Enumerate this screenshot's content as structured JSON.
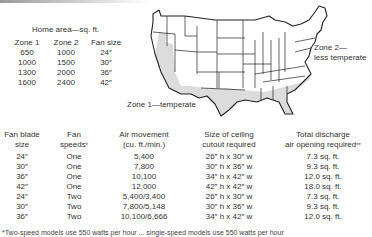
{
  "home_area": {
    "title": "Home area—sq. ft.",
    "headers": [
      "Zone 1",
      "Zone 2",
      "Fan size"
    ],
    "rows": [
      [
        "650",
        "1000",
        "24″"
      ],
      [
        "1000",
        "1500",
        "30″"
      ],
      [
        "1300",
        "2000",
        "36″"
      ],
      [
        "1600",
        "2400",
        "42″"
      ]
    ]
  },
  "map": {
    "zone1_label": "Zone 1—temperate",
    "zone2_label_line1": "Zone 2—",
    "zone2_label_line2": "less temperate",
    "zone1_fill": "#dcdcdc",
    "zone2_fill": "#ffffff",
    "outline_color": "#222222"
  },
  "fan_table": {
    "headers": [
      {
        "line1": "Fan blade",
        "line2": "size",
        "mark": ""
      },
      {
        "line1": "Fan",
        "line2": "speeds",
        "mark": "*"
      },
      {
        "line1": "Air movement",
        "line2": "(cu. ft./min.)",
        "mark": ""
      },
      {
        "line1": "Size of ceiling",
        "line2": "cutout required",
        "mark": ""
      },
      {
        "line1": "Total discharge",
        "line2": "air opening required",
        "mark": "**"
      }
    ],
    "rows": [
      [
        "24″",
        "One",
        "5,400",
        "26″ h x 30″ w",
        "7.3 sq. ft."
      ],
      [
        "30″",
        "One",
        "7,800",
        "30″ h x 36″ w",
        "9.3 sq. ft."
      ],
      [
        "36″",
        "One",
        "10,100",
        "34″ h x 42″ w",
        "12.0 sq. ft."
      ],
      [
        "42″",
        "One",
        "12,000",
        "42″ h x 42″ w",
        "18.0 sq. ft."
      ],
      [
        "24″",
        "Two",
        "5,400/3,400",
        "26″ h x 30″ w",
        "7.3 sq. ft."
      ],
      [
        "30″",
        "Two",
        "7,800/5,148",
        "30″ h x 36″ w",
        "9.3 sq. ft."
      ],
      [
        "36″",
        "Two",
        "10,100/6,666",
        "34″ h x 42″ w",
        "12.0 sq. ft."
      ]
    ]
  },
  "footnote": "*Two-speed models use 550 watts per hour ... single-speed models use 550 watts per hour"
}
